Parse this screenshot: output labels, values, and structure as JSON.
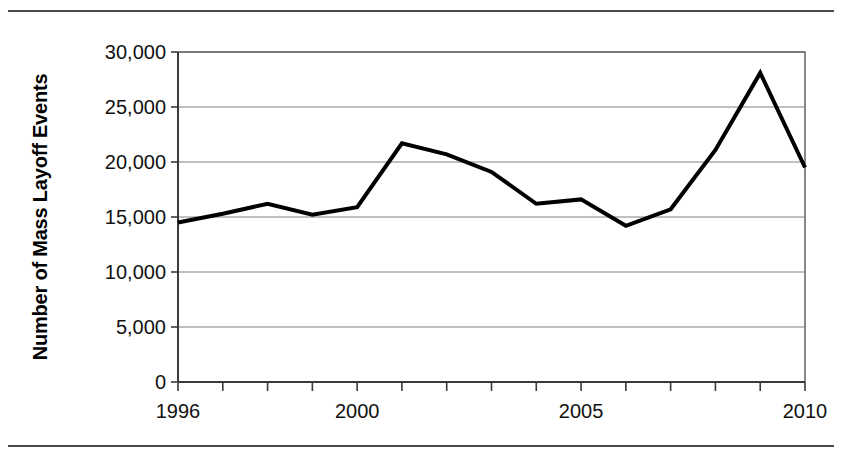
{
  "figure": {
    "has_top_rule": true,
    "has_bottom_rule": true,
    "rule_color": "#4a4a4a",
    "background": "#ffffff"
  },
  "chart_data": {
    "type": "line",
    "title": "",
    "subtitle": "",
    "xlabel": "",
    "ylabel": "Number of Mass Layoff Events",
    "x": [
      1996,
      1997,
      1998,
      1999,
      2000,
      2001,
      2002,
      2003,
      2004,
      2005,
      2006,
      2007,
      2008,
      2009,
      2010
    ],
    "values": [
      14500,
      15300,
      16200,
      15200,
      15900,
      21700,
      20700,
      19100,
      16200,
      16600,
      14200,
      15700,
      21100,
      28100,
      19500
    ],
    "series": [
      {
        "name": "Number of Mass Layoff Events",
        "color": "#000000",
        "line_width": 4,
        "values": [
          14500,
          15300,
          16200,
          15200,
          15900,
          21700,
          20700,
          19100,
          16200,
          16600,
          14200,
          15700,
          21100,
          28100,
          19500
        ]
      }
    ],
    "xlim": [
      1996,
      2010
    ],
    "ylim": [
      0,
      30000
    ],
    "ytick_values": [
      0,
      5000,
      10000,
      15000,
      20000,
      25000,
      30000
    ],
    "ytick_labels": [
      "0",
      "5,000",
      "10,000",
      "15,000",
      "20,000",
      "25,000",
      "30,000"
    ],
    "xtick_values": [
      1996,
      1997,
      1998,
      1999,
      2000,
      2001,
      2002,
      2003,
      2004,
      2005,
      2006,
      2007,
      2008,
      2009,
      2010
    ],
    "xtick_labels": [
      "1996",
      "",
      "",
      "",
      "2000",
      "",
      "",
      "",
      "",
      "2005",
      "",
      "",
      "",
      "",
      "2010"
    ],
    "grid": "horizontal",
    "gridline_color": "#808080",
    "axis_color": "#6b6b6b",
    "legend": null,
    "legend_position": "none",
    "annotations": []
  }
}
